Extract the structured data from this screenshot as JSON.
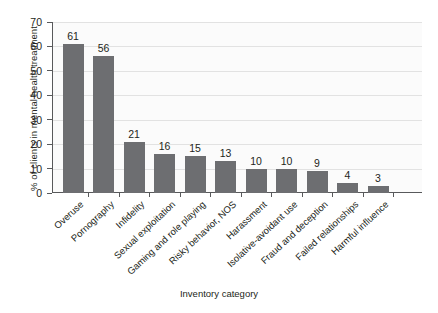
{
  "chart_data": {
    "type": "bar",
    "title": "",
    "xlabel": "Inventory category",
    "ylabel": "% of clients in mental health treatment",
    "ylim": [
      0,
      70
    ],
    "ytick_step": 10,
    "yticks": [
      70,
      60,
      50,
      40,
      30,
      20,
      10,
      0
    ],
    "grid": true,
    "legend": "none",
    "bar_color": "#6d6e71",
    "axis_color": "#58595b",
    "plot_background": "#fbfbfb",
    "categories": [
      "Overuse",
      "Pornography",
      "Infidelity",
      "Sexual exploitation",
      "Gaming and role playing",
      "Risky behavior, NOS",
      "Harassment",
      "Isolative-avoidant use",
      "Fraud and deception",
      "Failed relationships",
      "Harmful influence"
    ],
    "values": [
      61,
      56,
      21,
      16,
      15,
      13,
      10,
      10,
      9,
      4,
      3
    ]
  }
}
